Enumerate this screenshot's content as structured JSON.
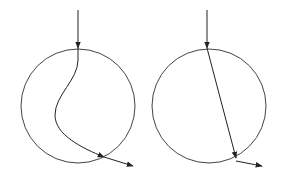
{
  "diagram": {
    "title": "",
    "stroke_color": "#333333",
    "background": "#ffffff",
    "panels": [
      {
        "name": "curved-path",
        "circle": {
          "cx": 78,
          "cy": 106,
          "r": 57
        },
        "incoming": {
          "x1": 78,
          "y1": 10,
          "x2": 78,
          "y2": 48
        },
        "path": "M78,48 L78,60 C78,80 55,95 55,115 C55,135 85,150 105,158",
        "exit": {
          "x1": 105,
          "y1": 158,
          "x2": 133,
          "y2": 167
        }
      },
      {
        "name": "straight-path",
        "circle": {
          "cx": 209,
          "cy": 106,
          "r": 57
        },
        "incoming": {
          "x1": 207,
          "y1": 10,
          "x2": 207,
          "y2": 48
        },
        "path": "M207,48 L236,158",
        "exit": {
          "x1": 236,
          "y1": 161,
          "x2": 262,
          "y2": 166
        }
      }
    ]
  }
}
